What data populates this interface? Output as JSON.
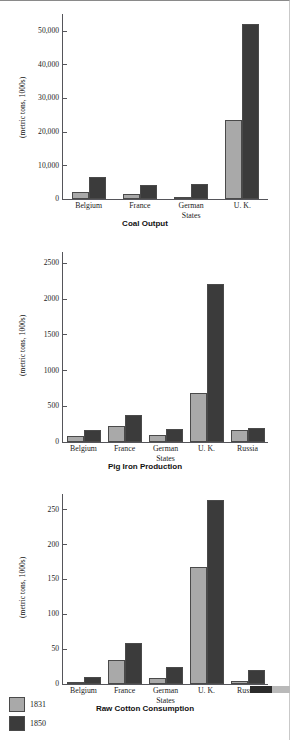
{
  "figure": {
    "legend": {
      "name": "series-legend",
      "entries": [
        {
          "label": "1831",
          "color": "#a9a9a9"
        },
        {
          "label": "1850",
          "color": "#3b3b3b"
        }
      ]
    }
  },
  "chart_data": [
    {
      "type": "bar",
      "title": "Coal Output",
      "xlabel": "",
      "ylabel": "(metric tons, 1000s)",
      "categories": [
        "Belgium",
        "France",
        "German States",
        "U. K."
      ],
      "categories_lines": [
        [
          "Belgium"
        ],
        [
          "France"
        ],
        [
          "German",
          "States"
        ],
        [
          "U. K."
        ]
      ],
      "yticks": [
        "0",
        "10,000",
        "20,000",
        "30,000",
        "40,000",
        "50,000"
      ],
      "ytick_values": [
        0,
        10000,
        20000,
        30000,
        40000,
        50000
      ],
      "ylim": [
        0,
        55000
      ],
      "grid": false,
      "legend_position": "bottom-left",
      "series": [
        {
          "name": "1831",
          "color": "#a9a9a9",
          "values": [
            2100,
            1400,
            650,
            23500
          ]
        },
        {
          "name": "1850",
          "color": "#3b3b3b",
          "values": [
            6400,
            4200,
            4600,
            52000
          ]
        }
      ]
    },
    {
      "type": "bar",
      "title": "Pig Iron Production",
      "xlabel": "",
      "ylabel": "(metric tons, 1000s)",
      "categories": [
        "Belgium",
        "France",
        "German States",
        "U. K.",
        "Russia"
      ],
      "categories_lines": [
        [
          "Belgium"
        ],
        [
          "France"
        ],
        [
          "German",
          "States"
        ],
        [
          "U. K."
        ],
        [
          "Russia"
        ]
      ],
      "yticks": [
        "0",
        "500",
        "1000",
        "1500",
        "2000",
        "2500"
      ],
      "ytick_values": [
        0,
        500,
        1000,
        1500,
        2000,
        2500
      ],
      "ylim": [
        0,
        2650
      ],
      "grid": false,
      "legend_position": "bottom-left",
      "series": [
        {
          "name": "1831",
          "color": "#a9a9a9",
          "values": [
            85,
            220,
            100,
            680,
            170
          ]
        },
        {
          "name": "1850",
          "color": "#3b3b3b",
          "values": [
            165,
            370,
            180,
            2200,
            195
          ]
        }
      ]
    },
    {
      "type": "bar",
      "title": "Raw Cotton Consumption",
      "xlabel": "",
      "ylabel": "(metric tons, 1000s)",
      "categories": [
        "Belgium",
        "France",
        "German States",
        "U. K.",
        "Russia"
      ],
      "categories_lines": [
        [
          "Belgium"
        ],
        [
          "France"
        ],
        [
          "German",
          "States"
        ],
        [
          "U. K."
        ],
        [
          "Russia"
        ]
      ],
      "yticks": [
        "0",
        "50",
        "100",
        "150",
        "200",
        "250"
      ],
      "ytick_values": [
        0,
        50,
        100,
        150,
        200,
        250
      ],
      "ylim": [
        0,
        272
      ],
      "grid": false,
      "legend_position": "bottom-left",
      "series": [
        {
          "name": "1831",
          "color": "#a9a9a9",
          "values": [
            2,
            34,
            8,
            168,
            5
          ]
        },
        {
          "name": "1850",
          "color": "#3b3b3b",
          "values": [
            10,
            59,
            25,
            263,
            20
          ]
        }
      ]
    }
  ]
}
